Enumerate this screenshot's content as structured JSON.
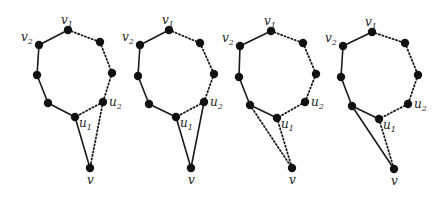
{
  "figure": {
    "colors": {
      "edge": "#1a1a1a",
      "node": "#111111",
      "background": "#ffffff"
    },
    "labels": {
      "v1": "v",
      "v1_sub": "1",
      "v2": "v",
      "v2_sub": "2",
      "u1": "u",
      "u1_sub": "1",
      "u2": "u",
      "u2_sub": "2",
      "v": "v"
    },
    "panels": [
      {
        "id": 1,
        "nodes": {
          "v1": [
            68,
            30
          ],
          "a": [
            100,
            42
          ],
          "b": [
            112,
            73
          ],
          "u2": [
            103,
            102
          ],
          "u1": [
            75,
            117
          ],
          "c": [
            48,
            103
          ],
          "d": [
            37,
            75
          ],
          "v2": [
            39,
            45
          ],
          "v": [
            90,
            168
          ]
        },
        "edges": [
          {
            "from": "v2",
            "to": "v1",
            "style": "solid"
          },
          {
            "from": "v1",
            "to": "a",
            "style": "dotted"
          },
          {
            "from": "a",
            "to": "b",
            "style": "dotted"
          },
          {
            "from": "b",
            "to": "u2",
            "style": "dotted"
          },
          {
            "from": "u2",
            "to": "u1",
            "style": "dotted"
          },
          {
            "from": "u1",
            "to": "c",
            "style": "solid"
          },
          {
            "from": "c",
            "to": "d",
            "style": "solid"
          },
          {
            "from": "d",
            "to": "v2",
            "style": "solid"
          },
          {
            "from": "u1",
            "to": "v",
            "style": "solid"
          },
          {
            "from": "u2",
            "to": "v",
            "style": "dotted"
          }
        ]
      },
      {
        "id": 2,
        "nodes": {
          "v1": [
            169,
            30
          ],
          "a": [
            200,
            43
          ],
          "b": [
            214,
            74
          ],
          "u2": [
            204,
            102
          ],
          "u1": [
            176,
            117
          ],
          "c": [
            149,
            104
          ],
          "d": [
            138,
            76
          ],
          "v2": [
            140,
            45
          ],
          "v": [
            191,
            168
          ]
        },
        "edges": [
          {
            "from": "v2",
            "to": "v1",
            "style": "solid"
          },
          {
            "from": "v1",
            "to": "a",
            "style": "dotted"
          },
          {
            "from": "a",
            "to": "b",
            "style": "dotted"
          },
          {
            "from": "b",
            "to": "u2",
            "style": "dotted"
          },
          {
            "from": "u2",
            "to": "u1",
            "style": "dotted"
          },
          {
            "from": "u1",
            "to": "c",
            "style": "solid"
          },
          {
            "from": "c",
            "to": "d",
            "style": "solid"
          },
          {
            "from": "d",
            "to": "v2",
            "style": "solid"
          },
          {
            "from": "u1",
            "to": "v",
            "style": "solid"
          },
          {
            "from": "u2",
            "to": "v",
            "style": "solid"
          }
        ]
      },
      {
        "id": 3,
        "nodes": {
          "v1": [
            271,
            31
          ],
          "a": [
            303,
            43
          ],
          "b": [
            316,
            74
          ],
          "u2": [
            305,
            102
          ],
          "u1": [
            277,
            118
          ],
          "c": [
            250,
            105
          ],
          "d": [
            239,
            77
          ],
          "v2": [
            240,
            46
          ],
          "v": [
            292,
            168
          ]
        },
        "edges": [
          {
            "from": "v2",
            "to": "v1",
            "style": "solid"
          },
          {
            "from": "v1",
            "to": "a",
            "style": "dotted"
          },
          {
            "from": "a",
            "to": "b",
            "style": "dotted"
          },
          {
            "from": "b",
            "to": "u2",
            "style": "dotted"
          },
          {
            "from": "u2",
            "to": "u1",
            "style": "dotted"
          },
          {
            "from": "u1",
            "to": "c",
            "style": "solid"
          },
          {
            "from": "c",
            "to": "d",
            "style": "solid"
          },
          {
            "from": "d",
            "to": "v2",
            "style": "solid"
          },
          {
            "from": "u1",
            "to": "v",
            "style": "dotted"
          },
          {
            "from": "c",
            "to": "v",
            "style": "dotted"
          }
        ]
      },
      {
        "id": 4,
        "nodes": {
          "v1": [
            372,
            32
          ],
          "a": [
            405,
            43
          ],
          "b": [
            418,
            75
          ],
          "u2": [
            408,
            104
          ],
          "u1": [
            379,
            119
          ],
          "c": [
            352,
            106
          ],
          "d": [
            341,
            77
          ],
          "v2": [
            343,
            46
          ],
          "v": [
            394,
            169
          ]
        },
        "edges": [
          {
            "from": "v2",
            "to": "v1",
            "style": "solid"
          },
          {
            "from": "v1",
            "to": "a",
            "style": "dotted"
          },
          {
            "from": "a",
            "to": "b",
            "style": "dotted"
          },
          {
            "from": "b",
            "to": "u2",
            "style": "dotted"
          },
          {
            "from": "u2",
            "to": "u1",
            "style": "dotted"
          },
          {
            "from": "u1",
            "to": "c",
            "style": "solid"
          },
          {
            "from": "c",
            "to": "d",
            "style": "solid"
          },
          {
            "from": "d",
            "to": "v2",
            "style": "solid"
          },
          {
            "from": "u1",
            "to": "v",
            "style": "dotted"
          },
          {
            "from": "c",
            "to": "v",
            "style": "solid"
          }
        ]
      }
    ]
  }
}
